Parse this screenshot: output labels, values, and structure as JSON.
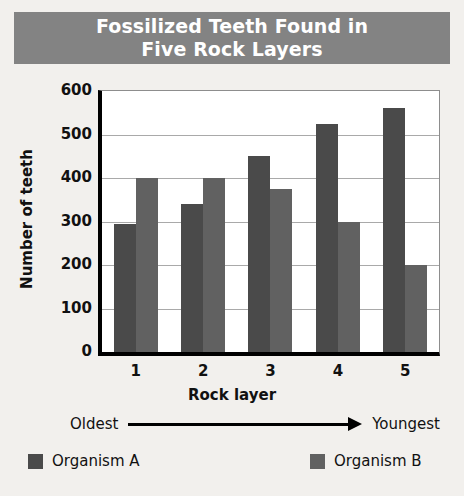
{
  "title": {
    "line1": "Fossilized Teeth Found in",
    "line2": "Five Rock Layers",
    "full": "Fossilized Teeth Found in Five Rock Layers",
    "banner_color": "#838383",
    "text_color": "#ffffff"
  },
  "annotation": {
    "oldest_label": "Oldest",
    "youngest_label": "Youngest",
    "arrow": "right-arrow"
  },
  "legend": {
    "position": "bottom",
    "items": [
      {
        "label": "Organism A",
        "color": "#4a4a4a"
      },
      {
        "label": "Organism B",
        "color": "#616161"
      }
    ]
  },
  "chart_data": {
    "type": "bar",
    "title": "Fossilized Teeth Found in Five Rock Layers",
    "xlabel": "Rock layer",
    "ylabel": "Number of teeth",
    "categories": [
      "1",
      "2",
      "3",
      "4",
      "5"
    ],
    "series": [
      {
        "name": "Organism A",
        "color": "#4a4a4a",
        "values": [
          295,
          340,
          450,
          525,
          560
        ]
      },
      {
        "name": "Organism B",
        "color": "#616161",
        "values": [
          400,
          400,
          375,
          300,
          200
        ]
      }
    ],
    "ylim": [
      0,
      600
    ],
    "ytick_step": 100,
    "yticks": [
      0,
      100,
      200,
      300,
      400,
      500,
      600
    ],
    "ytick_labels": [
      "0",
      "100",
      "200",
      "300",
      "400",
      "500",
      "600"
    ],
    "grid": true,
    "grid_axis": "y",
    "legend_position": "bottom",
    "annotations": [
      "Oldest",
      "Youngest"
    ]
  }
}
